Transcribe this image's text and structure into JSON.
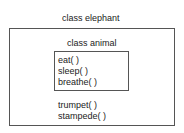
{
  "outer_class": {
    "title": "class elephant",
    "methods": [
      "trumpet( )",
      "stampede( )"
    ]
  },
  "inner_class": {
    "title": "class animal",
    "methods": [
      "eat( )",
      "sleep( )",
      "breathe( )"
    ]
  }
}
